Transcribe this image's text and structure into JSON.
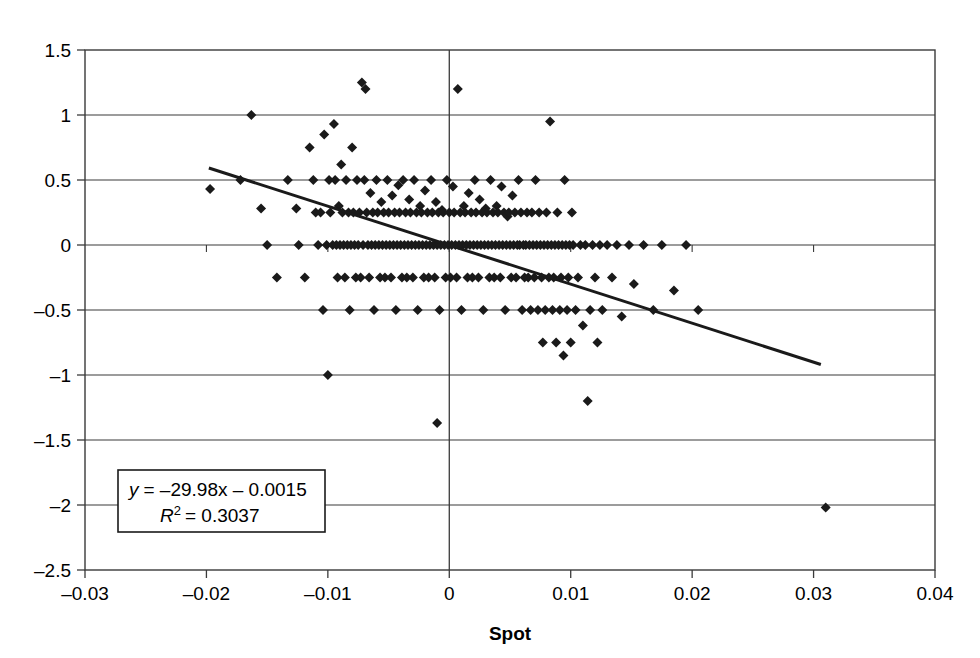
{
  "chart_data": {
    "type": "scatter",
    "title": "",
    "xlabel": "Spot",
    "ylabel": "",
    "xlim": [
      -0.03,
      0.04
    ],
    "ylim": [
      -2.5,
      1.5
    ],
    "grid": true,
    "xticks": [
      -0.03,
      -0.02,
      -0.01,
      0,
      0.01,
      0.02,
      0.03,
      0.04
    ],
    "xtick_labels": [
      "–0.03",
      "–0.02",
      "–0.01",
      "0",
      "0.01",
      "0.02",
      "0.03",
      "0.04"
    ],
    "yticks": [
      -2.5,
      -2,
      -1.5,
      -1,
      -0.5,
      0,
      0.5,
      1,
      1.5
    ],
    "ytick_labels": [
      "–2.5",
      "–2",
      "–1.5",
      "–1",
      "–0.5",
      "0",
      "0.5",
      "1",
      "1.5"
    ],
    "legend_position": "none",
    "annotation": {
      "equation": "y = –29.98x – 0.0015",
      "equation_lhs": "y",
      "equation_rhs": "= –29.98x – 0.0015",
      "r_squared_symbol": "R",
      "r_squared_exponent": "2",
      "r_squared_value": "= 0.3037",
      "slope": -29.98,
      "intercept": -0.0015,
      "r2": 0.3037
    },
    "trendline": {
      "x_start": -0.0198,
      "y_start": 0.5925,
      "x_end": 0.0306,
      "y_end": -0.9189,
      "color": "#1a1a1a",
      "width": 3
    },
    "marker": {
      "shape": "diamond",
      "size": 5,
      "color": "#1a1a1a"
    },
    "points": [
      [
        -0.0197,
        0.43
      ],
      [
        -0.0172,
        0.5
      ],
      [
        -0.0163,
        1.0
      ],
      [
        -0.0155,
        0.28
      ],
      [
        -0.015,
        0.0
      ],
      [
        -0.0142,
        -0.25
      ],
      [
        -0.0133,
        0.5
      ],
      [
        -0.0126,
        0.28
      ],
      [
        -0.0124,
        0.0
      ],
      [
        -0.0119,
        -0.25
      ],
      [
        -0.0115,
        0.75
      ],
      [
        -0.0112,
        0.5
      ],
      [
        -0.011,
        0.25
      ],
      [
        -0.0108,
        0.0
      ],
      [
        -0.0106,
        0.25
      ],
      [
        -0.0104,
        -0.5
      ],
      [
        -0.0103,
        0.85
      ],
      [
        -0.0101,
        0.0
      ],
      [
        -0.01,
        -1.0
      ],
      [
        -0.0099,
        0.5
      ],
      [
        -0.0098,
        0.25
      ],
      [
        -0.0096,
        0.0
      ],
      [
        -0.0095,
        0.93
      ],
      [
        -0.0094,
        0.5
      ],
      [
        -0.0093,
        0.0
      ],
      [
        -0.0092,
        -0.25
      ],
      [
        -0.0091,
        0.3
      ],
      [
        -0.009,
        0.0
      ],
      [
        -0.0089,
        0.62
      ],
      [
        -0.0088,
        0.25
      ],
      [
        -0.0087,
        0.0
      ],
      [
        -0.0086,
        -0.25
      ],
      [
        -0.0085,
        0.5
      ],
      [
        -0.0084,
        0.0
      ],
      [
        -0.0083,
        0.25
      ],
      [
        -0.0082,
        -0.5
      ],
      [
        -0.0081,
        0.0
      ],
      [
        -0.008,
        0.75
      ],
      [
        -0.0079,
        0.25
      ],
      [
        -0.0078,
        0.0
      ],
      [
        -0.0077,
        -0.25
      ],
      [
        -0.0076,
        0.5
      ],
      [
        -0.0075,
        0.0
      ],
      [
        -0.0074,
        0.25
      ],
      [
        -0.0073,
        -0.25
      ],
      [
        -0.0072,
        1.25
      ],
      [
        -0.0071,
        0.0
      ],
      [
        -0.007,
        0.5
      ],
      [
        -0.0069,
        1.2
      ],
      [
        -0.0068,
        0.25
      ],
      [
        -0.0067,
        0.0
      ],
      [
        -0.0066,
        -0.25
      ],
      [
        -0.0065,
        0.4
      ],
      [
        -0.0064,
        0.0
      ],
      [
        -0.0063,
        0.25
      ],
      [
        -0.0062,
        -0.5
      ],
      [
        -0.0061,
        0.0
      ],
      [
        -0.006,
        0.5
      ],
      [
        -0.0059,
        0.25
      ],
      [
        -0.0058,
        0.0
      ],
      [
        -0.0057,
        -0.25
      ],
      [
        -0.0056,
        0.33
      ],
      [
        -0.0055,
        0.0
      ],
      [
        -0.0054,
        0.25
      ],
      [
        -0.0053,
        -0.25
      ],
      [
        -0.0052,
        0.0
      ],
      [
        -0.0051,
        0.5
      ],
      [
        -0.005,
        0.25
      ],
      [
        -0.0049,
        0.0
      ],
      [
        -0.0048,
        -0.25
      ],
      [
        -0.0047,
        0.38
      ],
      [
        -0.0046,
        0.0
      ],
      [
        -0.0045,
        0.25
      ],
      [
        -0.0044,
        -0.5
      ],
      [
        -0.0043,
        0.0
      ],
      [
        -0.0042,
        0.46
      ],
      [
        -0.0041,
        0.25
      ],
      [
        -0.004,
        0.0
      ],
      [
        -0.0039,
        -0.25
      ],
      [
        -0.0038,
        0.5
      ],
      [
        -0.0037,
        0.0
      ],
      [
        -0.0036,
        0.25
      ],
      [
        -0.0035,
        -0.25
      ],
      [
        -0.0034,
        0.0
      ],
      [
        -0.0033,
        0.35
      ],
      [
        -0.0032,
        0.25
      ],
      [
        -0.0031,
        0.0
      ],
      [
        -0.003,
        -0.25
      ],
      [
        -0.0029,
        0.5
      ],
      [
        -0.0028,
        0.0
      ],
      [
        -0.0027,
        0.25
      ],
      [
        -0.0026,
        -0.5
      ],
      [
        -0.0025,
        0.0
      ],
      [
        -0.0024,
        0.3
      ],
      [
        -0.0023,
        0.25
      ],
      [
        -0.0022,
        0.0
      ],
      [
        -0.0021,
        -0.25
      ],
      [
        -0.002,
        0.42
      ],
      [
        -0.0019,
        0.0
      ],
      [
        -0.0018,
        0.25
      ],
      [
        -0.0017,
        -0.25
      ],
      [
        -0.0016,
        0.0
      ],
      [
        -0.0015,
        0.5
      ],
      [
        -0.0014,
        0.25
      ],
      [
        -0.0013,
        0.0
      ],
      [
        -0.0012,
        -0.25
      ],
      [
        -0.0011,
        0.33
      ],
      [
        -0.001,
        0.0
      ],
      [
        -0.001,
        -1.37
      ],
      [
        -0.0009,
        0.25
      ],
      [
        -0.0008,
        -0.5
      ],
      [
        -0.0007,
        0.0
      ],
      [
        -0.0006,
        0.27
      ],
      [
        -0.0005,
        0.25
      ],
      [
        -0.0004,
        0.0
      ],
      [
        -0.0003,
        -0.25
      ],
      [
        -0.0002,
        0.5
      ],
      [
        -0.0001,
        0.0
      ],
      [
        0.0,
        0.25
      ],
      [
        0.0001,
        -0.25
      ],
      [
        0.0002,
        0.0
      ],
      [
        0.0003,
        0.45
      ],
      [
        0.0004,
        0.25
      ],
      [
        0.0005,
        0.0
      ],
      [
        0.0006,
        -0.25
      ],
      [
        0.0007,
        1.2
      ],
      [
        0.0008,
        0.0
      ],
      [
        0.0009,
        0.25
      ],
      [
        0.001,
        -0.5
      ],
      [
        0.0011,
        0.0
      ],
      [
        0.0012,
        0.3
      ],
      [
        0.0013,
        0.25
      ],
      [
        0.0014,
        0.0
      ],
      [
        0.0015,
        -0.25
      ],
      [
        0.0016,
        0.4
      ],
      [
        0.0017,
        0.0
      ],
      [
        0.0018,
        0.25
      ],
      [
        0.0019,
        -0.25
      ],
      [
        0.002,
        0.0
      ],
      [
        0.0021,
        0.5
      ],
      [
        0.0022,
        0.25
      ],
      [
        0.0023,
        0.0
      ],
      [
        0.0024,
        -0.25
      ],
      [
        0.0025,
        0.35
      ],
      [
        0.0026,
        0.0
      ],
      [
        0.0027,
        0.25
      ],
      [
        0.0028,
        -0.5
      ],
      [
        0.0029,
        0.0
      ],
      [
        0.003,
        0.28
      ],
      [
        0.0031,
        0.25
      ],
      [
        0.0032,
        0.0
      ],
      [
        0.0033,
        -0.25
      ],
      [
        0.0034,
        0.5
      ],
      [
        0.0035,
        0.0
      ],
      [
        0.0036,
        0.25
      ],
      [
        0.0037,
        -0.25
      ],
      [
        0.0038,
        0.0
      ],
      [
        0.0039,
        0.3
      ],
      [
        0.004,
        0.25
      ],
      [
        0.0041,
        0.0
      ],
      [
        0.0042,
        -0.25
      ],
      [
        0.0043,
        0.45
      ],
      [
        0.0044,
        0.0
      ],
      [
        0.0045,
        0.25
      ],
      [
        0.0046,
        -0.5
      ],
      [
        0.0047,
        0.0
      ],
      [
        0.0048,
        0.22
      ],
      [
        0.0049,
        0.25
      ],
      [
        0.005,
        0.0
      ],
      [
        0.0051,
        -0.25
      ],
      [
        0.0052,
        0.38
      ],
      [
        0.0053,
        0.0
      ],
      [
        0.0054,
        0.25
      ],
      [
        0.0055,
        -0.25
      ],
      [
        0.0056,
        0.0
      ],
      [
        0.0057,
        0.5
      ],
      [
        0.0058,
        0.0
      ],
      [
        0.0059,
        0.25
      ],
      [
        0.006,
        -0.5
      ],
      [
        0.0061,
        0.0
      ],
      [
        0.0062,
        -0.25
      ],
      [
        0.0063,
        0.0
      ],
      [
        0.0064,
        0.25
      ],
      [
        0.0065,
        -0.25
      ],
      [
        0.0066,
        0.0
      ],
      [
        0.0067,
        -0.5
      ],
      [
        0.0068,
        0.25
      ],
      [
        0.0069,
        0.0
      ],
      [
        0.007,
        -0.25
      ],
      [
        0.0071,
        0.5
      ],
      [
        0.0072,
        0.0
      ],
      [
        0.0073,
        -0.5
      ],
      [
        0.0074,
        0.25
      ],
      [
        0.0075,
        0.0
      ],
      [
        0.0076,
        -0.25
      ],
      [
        0.0077,
        -0.75
      ],
      [
        0.0078,
        0.0
      ],
      [
        0.0079,
        -0.5
      ],
      [
        0.008,
        0.25
      ],
      [
        0.0081,
        0.0
      ],
      [
        0.0082,
        -0.25
      ],
      [
        0.0083,
        0.95
      ],
      [
        0.0084,
        0.0
      ],
      [
        0.0085,
        -0.5
      ],
      [
        0.0086,
        -0.25
      ],
      [
        0.0087,
        0.0
      ],
      [
        0.0088,
        -0.75
      ],
      [
        0.0089,
        0.25
      ],
      [
        0.009,
        0.0
      ],
      [
        0.0091,
        -0.5
      ],
      [
        0.0092,
        -0.25
      ],
      [
        0.0093,
        0.0
      ],
      [
        0.0094,
        -0.85
      ],
      [
        0.0095,
        0.5
      ],
      [
        0.0096,
        0.0
      ],
      [
        0.0097,
        -0.5
      ],
      [
        0.0098,
        -0.25
      ],
      [
        0.0099,
        0.0
      ],
      [
        0.01,
        -0.75
      ],
      [
        0.0101,
        0.25
      ],
      [
        0.0102,
        0.0
      ],
      [
        0.0104,
        -0.5
      ],
      [
        0.0106,
        -0.25
      ],
      [
        0.0108,
        0.0
      ],
      [
        0.011,
        -0.62
      ],
      [
        0.0112,
        0.0
      ],
      [
        0.0114,
        -1.2
      ],
      [
        0.0116,
        -0.5
      ],
      [
        0.0118,
        0.0
      ],
      [
        0.012,
        -0.25
      ],
      [
        0.0122,
        -0.75
      ],
      [
        0.0124,
        0.0
      ],
      [
        0.0126,
        -0.5
      ],
      [
        0.013,
        0.0
      ],
      [
        0.0134,
        -0.25
      ],
      [
        0.0138,
        0.0
      ],
      [
        0.0142,
        -0.55
      ],
      [
        0.0148,
        0.0
      ],
      [
        0.0152,
        -0.3
      ],
      [
        0.016,
        0.0
      ],
      [
        0.0168,
        -0.5
      ],
      [
        0.0175,
        0.0
      ],
      [
        0.0185,
        -0.35
      ],
      [
        0.0195,
        0.0
      ],
      [
        0.0205,
        -0.5
      ],
      [
        0.031,
        -2.02
      ]
    ],
    "n_points_approx": 520
  },
  "axes_geometry": {
    "plot_left": 85,
    "plot_right": 935,
    "plot_top": 50,
    "plot_bottom": 570
  }
}
